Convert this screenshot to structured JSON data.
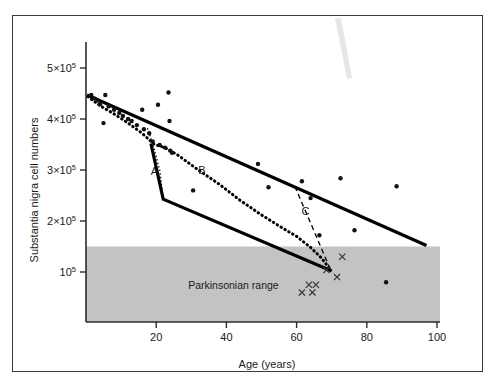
{
  "figure": {
    "title": "",
    "frame": {
      "x": 12,
      "y": 15,
      "w": 471,
      "h": 357
    }
  },
  "chart_data": {
    "type": "scatter",
    "title": "",
    "xlabel": "Age (years)",
    "ylabel": "Substantia nigra cell numbers",
    "xlim": [
      0,
      100
    ],
    "ylim": [
      0,
      550000
    ],
    "grid": false,
    "legend": "none",
    "xticks": [
      20,
      40,
      60,
      80,
      100
    ],
    "xtick_labels": [
      "20",
      "40",
      "60",
      "80",
      "100"
    ],
    "yticks": [
      500000,
      400000,
      300000,
      200000,
      100000
    ],
    "ytick_labels": [
      {
        "mantissa": "5×10",
        "exponent": "5"
      },
      {
        "mantissa": "4×10",
        "exponent": "5"
      },
      {
        "mantissa": "3×10",
        "exponent": "5"
      },
      {
        "mantissa": "2×10",
        "exponent": "5"
      },
      {
        "mantissa": "10",
        "exponent": "5"
      }
    ],
    "shaded_region": {
      "label": "Parkinsonian range",
      "color": "#c3c3c3",
      "y_from": 0,
      "y_to": 150000,
      "label_x": 42,
      "label_y": 75000
    },
    "annotations": [
      {
        "text": "A",
        "x": 19.5,
        "y": 290000
      },
      {
        "text": "B",
        "x": 33.0,
        "y": 292000
      },
      {
        "text": "C",
        "x": 62.5,
        "y": 212000
      }
    ],
    "series": [
      {
        "name": "normal-ageing-scatter",
        "marker": "dot",
        "points": [
          [
            1.5,
            447000
          ],
          [
            2.5,
            440000
          ],
          [
            3.5,
            436000
          ],
          [
            4.0,
            429000
          ],
          [
            5.5,
            447000
          ],
          [
            5.0,
            392000
          ],
          [
            6.5,
            425000
          ],
          [
            8.0,
            418000
          ],
          [
            9.5,
            412000
          ],
          [
            10.5,
            406000
          ],
          [
            12.0,
            400000
          ],
          [
            13.0,
            396000
          ],
          [
            14.5,
            388000
          ],
          [
            16.0,
            418000
          ],
          [
            16.5,
            380000
          ],
          [
            18.0,
            372000
          ],
          [
            19.0,
            356000
          ],
          [
            20.5,
            428000
          ],
          [
            21.0,
            349000
          ],
          [
            22.5,
            344000
          ],
          [
            23.5,
            452000
          ],
          [
            23.8,
            396000
          ],
          [
            24.0,
            338000
          ],
          [
            24.5,
            334000
          ],
          [
            30.5,
            260000
          ],
          [
            49.0,
            312000
          ],
          [
            52.0,
            266000
          ],
          [
            61.5,
            278000
          ],
          [
            64.0,
            245000
          ],
          [
            66.5,
            172000
          ],
          [
            72.5,
            284000
          ],
          [
            76.5,
            182000
          ],
          [
            85.5,
            80000
          ],
          [
            88.5,
            268000
          ]
        ]
      },
      {
        "name": "parkinsonian-cases",
        "marker": "x",
        "points": [
          [
            61.5,
            60000
          ],
          [
            63.5,
            75000
          ],
          [
            64.5,
            60000
          ],
          [
            65.5,
            75000
          ],
          [
            68.5,
            104000
          ],
          [
            71.5,
            90000
          ],
          [
            73.0,
            130000
          ]
        ]
      }
    ],
    "curves": [
      {
        "name": "upper-envelope",
        "style": "solid-thick",
        "points": [
          [
            0.3,
            447000
          ],
          [
            97.0,
            152000
          ]
        ]
      },
      {
        "name": "lower-envelope",
        "style": "solid-thick",
        "points": [
          [
            18.5,
            352000
          ],
          [
            22.0,
            243000
          ],
          [
            70.0,
            102000
          ]
        ]
      },
      {
        "name": "curve-B-dotted",
        "style": "dotted-thick",
        "points": [
          [
            0.5,
            444000
          ],
          [
            4.0,
            426000
          ],
          [
            8.0,
            410000
          ],
          [
            12.0,
            392000
          ],
          [
            16.0,
            372000
          ],
          [
            19.5,
            350000
          ],
          [
            22.5,
            344000
          ],
          [
            26.0,
            330000
          ],
          [
            32.0,
            300000
          ],
          [
            38.0,
            272000
          ],
          [
            44.0,
            240000
          ],
          [
            50.0,
            212000
          ],
          [
            56.0,
            186000
          ],
          [
            60.0,
            170000
          ],
          [
            64.0,
            148000
          ],
          [
            67.0,
            128000
          ],
          [
            69.5,
            106000
          ]
        ]
      },
      {
        "name": "curve-A-thin-dotted",
        "style": "thin-dotted",
        "points": [
          [
            17.5,
            382000
          ],
          [
            19.0,
            352000
          ],
          [
            21.0,
            300000
          ],
          [
            22.0,
            244000
          ]
        ]
      },
      {
        "name": "curve-C-dashed",
        "style": "dashed",
        "points": [
          [
            59.5,
            268000
          ],
          [
            64.0,
            196000
          ],
          [
            69.8,
            102000
          ]
        ]
      }
    ]
  }
}
